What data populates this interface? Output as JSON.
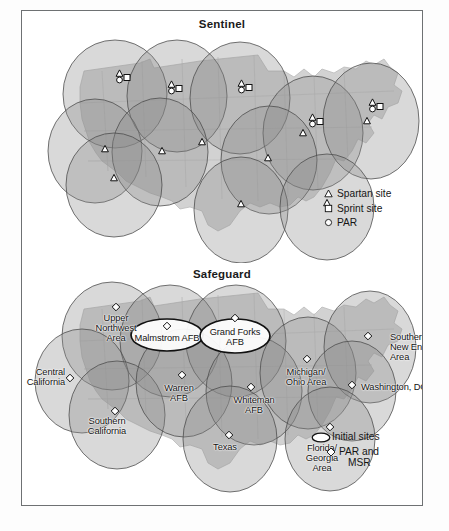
{
  "figure": {
    "panels": [
      {
        "id": "sentinel",
        "title": "Sentinel",
        "legend": {
          "items": [
            {
              "icon": "triangle-icon",
              "label": "Spartan site"
            },
            {
              "icon": "square-icon",
              "label": "Sprint site"
            },
            {
              "icon": "circle-icon",
              "label": "PAR"
            }
          ]
        },
        "labels": [],
        "sites": [
          {
            "x": 100,
            "y": 66,
            "markers": [
              "triangle",
              "circle",
              "square"
            ]
          },
          {
            "x": 152,
            "y": 77,
            "markers": [
              "triangle",
              "circle",
              "square"
            ]
          },
          {
            "x": 222,
            "y": 76,
            "markers": [
              "triangle",
              "circle",
              "square"
            ]
          },
          {
            "x": 293,
            "y": 110,
            "markers": [
              "triangle",
              "circle",
              "square"
            ]
          },
          {
            "x": 353,
            "y": 95,
            "markers": [
              "triangle",
              "circle",
              "square"
            ]
          },
          {
            "x": 83,
            "y": 138,
            "markers": [
              "triangle"
            ]
          },
          {
            "x": 140,
            "y": 140,
            "markers": [
              "triangle"
            ]
          },
          {
            "x": 180,
            "y": 131,
            "markers": [
              "triangle"
            ]
          },
          {
            "x": 92,
            "y": 167,
            "markers": [
              "triangle"
            ]
          },
          {
            "x": 246,
            "y": 147,
            "markers": [
              "triangle"
            ]
          },
          {
            "x": 281,
            "y": 122,
            "markers": [
              "triangle"
            ]
          },
          {
            "x": 345,
            "y": 110,
            "markers": [
              "triangle"
            ]
          },
          {
            "x": 219,
            "y": 193,
            "markers": [
              "triangle"
            ]
          },
          {
            "x": 305,
            "y": 192,
            "markers": [
              "triangle"
            ]
          }
        ],
        "coverage_ellipses": [
          {
            "cx": 93,
            "cy": 83,
            "rx": 52,
            "ry": 54
          },
          {
            "cx": 155,
            "cy": 85,
            "rx": 50,
            "ry": 56
          },
          {
            "cx": 218,
            "cy": 87,
            "rx": 50,
            "ry": 56
          },
          {
            "cx": 291,
            "cy": 122,
            "rx": 50,
            "ry": 57
          },
          {
            "cx": 349,
            "cy": 110,
            "rx": 48,
            "ry": 58
          },
          {
            "cx": 73,
            "cy": 140,
            "rx": 47,
            "ry": 52
          },
          {
            "cx": 138,
            "cy": 141,
            "rx": 48,
            "ry": 54
          },
          {
            "cx": 92,
            "cy": 174,
            "rx": 48,
            "ry": 52
          },
          {
            "cx": 247,
            "cy": 149,
            "rx": 48,
            "ry": 54
          },
          {
            "cx": 219,
            "cy": 199,
            "rx": 47,
            "ry": 53
          },
          {
            "cx": 305,
            "cy": 196,
            "rx": 47,
            "ry": 53
          }
        ]
      },
      {
        "id": "safeguard",
        "title": "Safeguard",
        "legend": {
          "items": [
            {
              "icon": "ellipse-outline-icon",
              "label": "Initial sites"
            },
            {
              "icon": "diamond-icon",
              "label": "PAR and MSR",
              "line1": "PAR and",
              "line2": "MSR"
            }
          ]
        },
        "sites": [
          {
            "name": "Upper Northwest Area",
            "lines": [
              "Upper",
              "Northwest",
              "Area"
            ],
            "x": 94,
            "y": 44,
            "lx": 94,
            "ly": 50,
            "anchor": "center",
            "initial": false
          },
          {
            "name": "Malmstrom AFB",
            "lines": [
              "Malmstrom AFB"
            ],
            "x": 145,
            "y": 63,
            "lx": 145,
            "ly": 70,
            "anchor": "center",
            "initial": true,
            "ex": 145,
            "ey": 72,
            "erx": 36,
            "ery": 16
          },
          {
            "name": "Grand Forks AFB",
            "lines": [
              "Grand Forks",
              "AFB"
            ],
            "x": 213,
            "y": 55,
            "lx": 213,
            "ly": 64,
            "anchor": "center",
            "initial": true,
            "ex": 213,
            "ey": 73,
            "erx": 35,
            "ery": 17
          },
          {
            "name": "Central California",
            "lines": [
              "Central",
              "California"
            ],
            "x": 48,
            "y": 115,
            "lx": 43,
            "ly": 104,
            "anchor": "right",
            "initial": false
          },
          {
            "name": "Southern California",
            "lines": [
              "Southern",
              "California"
            ],
            "x": 93,
            "y": 148,
            "lx": 85,
            "ly": 153,
            "anchor": "center",
            "initial": false
          },
          {
            "name": "Warren AFB",
            "lines": [
              "Warren",
              "AFB"
            ],
            "x": 160,
            "y": 112,
            "lx": 157,
            "ly": 120,
            "anchor": "center",
            "initial": false
          },
          {
            "name": "Whiteman AFB",
            "lines": [
              "Whiteman",
              "AFB"
            ],
            "x": 229,
            "y": 124,
            "lx": 232,
            "ly": 132,
            "anchor": "center",
            "initial": false
          },
          {
            "name": "Texas",
            "lines": [
              "Texas"
            ],
            "x": 207,
            "y": 172,
            "lx": 203,
            "ly": 179,
            "anchor": "center",
            "initial": false
          },
          {
            "name": "Michigan/Ohio Area",
            "lines": [
              "Michigan/",
              "Ohio Area"
            ],
            "x": 285,
            "y": 96,
            "lx": 284,
            "ly": 104,
            "anchor": "center",
            "initial": false
          },
          {
            "name": "Southern New England Area",
            "lines": [
              "Southern",
              "New England",
              "Area"
            ],
            "x": 346,
            "y": 73,
            "lx": 368,
            "ly": 69,
            "anchor": "left",
            "initial": false
          },
          {
            "name": "Washington, DC",
            "lines": [
              "Washington, DC"
            ],
            "x": 330,
            "y": 122,
            "lx": 339,
            "ly": 119,
            "anchor": "left",
            "initial": false
          },
          {
            "name": "Florida/Georgia Area",
            "lines": [
              "Florida/",
              "Georgia",
              "Area"
            ],
            "x": 308,
            "y": 164,
            "lx": 300,
            "ly": 180,
            "anchor": "center",
            "initial": false
          }
        ],
        "coverage_ellipses": [
          {
            "cx": 90,
            "cy": 73,
            "rx": 50,
            "ry": 54
          },
          {
            "cx": 148,
            "cy": 78,
            "rx": 50,
            "ry": 56
          },
          {
            "cx": 214,
            "cy": 78,
            "rx": 50,
            "ry": 56
          },
          {
            "cx": 60,
            "cy": 118,
            "rx": 47,
            "ry": 52
          },
          {
            "cx": 95,
            "cy": 152,
            "rx": 48,
            "ry": 54
          },
          {
            "cx": 162,
            "cy": 120,
            "rx": 48,
            "ry": 54
          },
          {
            "cx": 232,
            "cy": 128,
            "rx": 48,
            "ry": 54
          },
          {
            "cx": 208,
            "cy": 176,
            "rx": 47,
            "ry": 53
          },
          {
            "cx": 286,
            "cy": 110,
            "rx": 48,
            "ry": 56
          },
          {
            "cx": 348,
            "cy": 84,
            "rx": 46,
            "ry": 56
          },
          {
            "cx": 330,
            "cy": 128,
            "rx": 44,
            "ry": 50
          },
          {
            "cx": 308,
            "cy": 176,
            "rx": 45,
            "ry": 52
          }
        ]
      }
    ],
    "colors": {
      "frame": "#6e7173",
      "land": "#c9c9c9",
      "land_light": "#dcdcdc",
      "coverage_fill": "#8d8d8d",
      "coverage_stroke": "#4a4a4a",
      "marker_fill": "#ffffff",
      "marker_stroke": "#111111",
      "text": "#111111"
    }
  }
}
